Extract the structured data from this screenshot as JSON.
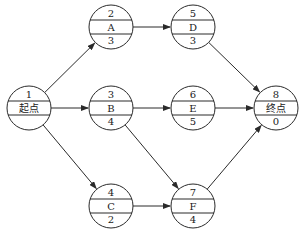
{
  "diagram": {
    "type": "activity-on-node network",
    "nodes": [
      {
        "id": "n1",
        "number": "1",
        "name": "起点",
        "duration": "",
        "cx": 29,
        "cy": 108
      },
      {
        "id": "nA",
        "number": "2",
        "name": "A",
        "duration": "3",
        "cx": 111,
        "cy": 27
      },
      {
        "id": "nB",
        "number": "3",
        "name": "B",
        "duration": "4",
        "cx": 111,
        "cy": 108
      },
      {
        "id": "nC",
        "number": "4",
        "name": "C",
        "duration": "2",
        "cx": 111,
        "cy": 206
      },
      {
        "id": "nD",
        "number": "5",
        "name": "D",
        "duration": "3",
        "cx": 193,
        "cy": 27
      },
      {
        "id": "nE",
        "number": "6",
        "name": "E",
        "duration": "5",
        "cx": 193,
        "cy": 108
      },
      {
        "id": "nF",
        "number": "7",
        "name": "F",
        "duration": "4",
        "cx": 193,
        "cy": 206
      },
      {
        "id": "n8",
        "number": "8",
        "name": "终点",
        "duration": "0",
        "cx": 276,
        "cy": 108
      }
    ],
    "edges": [
      {
        "from": "n1",
        "to": "nA"
      },
      {
        "from": "n1",
        "to": "nB"
      },
      {
        "from": "n1",
        "to": "nC"
      },
      {
        "from": "nA",
        "to": "nD"
      },
      {
        "from": "nB",
        "to": "nE"
      },
      {
        "from": "nB",
        "to": "nF"
      },
      {
        "from": "nC",
        "to": "nF"
      },
      {
        "from": "nD",
        "to": "n8"
      },
      {
        "from": "nE",
        "to": "n8"
      },
      {
        "from": "nF",
        "to": "n8"
      }
    ],
    "style": {
      "node_radius": 22,
      "stroke_color": "#2a2a2a",
      "background": "#ffffff"
    }
  }
}
